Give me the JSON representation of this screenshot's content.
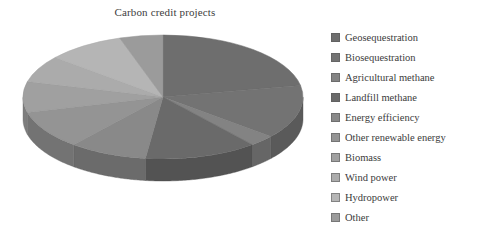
{
  "chart": {
    "title": "Carbon credit projects",
    "background": "#ffffff",
    "text_color": "#3b3b3b"
  },
  "legend": {
    "position": "right",
    "items": [
      {
        "label": "Geosequestration",
        "color": "#6e6e6e"
      },
      {
        "label": "Biosequestration",
        "color": "#737373"
      },
      {
        "label": "Agricultural methane",
        "color": "#838383"
      },
      {
        "label": "Landfill methane",
        "color": "#6a6a6a"
      },
      {
        "label": "Energy efficiency",
        "color": "#898989"
      },
      {
        "label": "Other renewable energy",
        "color": "#949494"
      },
      {
        "label": "Biomass",
        "color": "#a0a0a0"
      },
      {
        "label": "Wind power",
        "color": "#ababab"
      },
      {
        "label": "Hydropower",
        "color": "#b5b5b5"
      },
      {
        "label": "Other",
        "color": "#9b9b9b"
      }
    ]
  },
  "chart_data": {
    "type": "pie",
    "title": "Carbon credit projects",
    "three_d": true,
    "legend_position": "right",
    "grid": false,
    "xlabel": "",
    "ylabel": "",
    "categories": [
      "Geosequestration",
      "Biosequestration",
      "Agricultural methane",
      "Landfill methane",
      "Energy efficiency",
      "Other renewable energy",
      "Biomass",
      "Wind power",
      "Hydropower",
      "Other"
    ],
    "values": [
      22,
      14,
      3,
      13,
      9,
      10,
      8,
      7,
      9,
      5
    ],
    "units": "percent",
    "colors": [
      "#6e6e6e",
      "#737373",
      "#838383",
      "#6a6a6a",
      "#898989",
      "#949494",
      "#a0a0a0",
      "#ababab",
      "#b5b5b5",
      "#9b9b9b"
    ],
    "geometry": {
      "center_x": 163,
      "center_y": 97,
      "radius_x": 140,
      "radius_y": 62,
      "depth": 22,
      "start_angle_deg": -90
    }
  }
}
